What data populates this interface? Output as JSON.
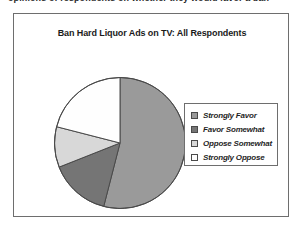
{
  "page": {
    "clipped_text_line": "opinions of respondents on whether they would favor a ban"
  },
  "figure": {
    "title": "Ban Hard Liquor Ads on TV: All Respondents",
    "border_color": "#6e6e6e",
    "background": "#ffffff"
  },
  "legend": {
    "position": "right",
    "items": [
      {
        "label": "Strongly Favor",
        "color": "#9a9a9a"
      },
      {
        "label": "Favor Somewhat",
        "color": "#757575"
      },
      {
        "label": "Oppose Somewhat",
        "color": "#d8d8d8"
      },
      {
        "label": "Strongly Oppose",
        "color": "#fefefe"
      }
    ]
  },
  "chart_data": {
    "type": "pie",
    "title": "Ban Hard Liquor Ads on TV: All Respondents",
    "xlabel": "",
    "ylabel": "",
    "legend_position": "right",
    "grid": false,
    "start_angle_deg": 0,
    "direction": "clockwise",
    "categories": [
      "Strongly Favor",
      "Favor Somewhat",
      "Oppose Somewhat",
      "Strongly Oppose"
    ],
    "values": [
      54,
      15,
      10,
      21
    ],
    "units": "percent",
    "colors": [
      "#9a9a9a",
      "#757575",
      "#d8d8d8",
      "#fefefe"
    ],
    "slice_edge_color": "#4a4a4a",
    "slices": [
      {
        "label": "Strongly Favor",
        "value": 54,
        "start_deg": 0,
        "end_deg": 194.4,
        "color": "#9a9a9a"
      },
      {
        "label": "Favor Somewhat",
        "value": 15,
        "start_deg": 194.4,
        "end_deg": 248.4,
        "color": "#757575"
      },
      {
        "label": "Oppose Somewhat",
        "value": 10,
        "start_deg": 248.4,
        "end_deg": 284.4,
        "color": "#d8d8d8"
      },
      {
        "label": "Strongly Oppose",
        "value": 21,
        "start_deg": 284.4,
        "end_deg": 360,
        "color": "#fefefe"
      }
    ]
  }
}
